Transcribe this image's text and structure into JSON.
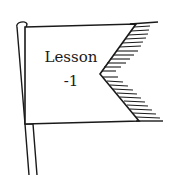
{
  "illustration": {
    "type": "hand-drawn flag",
    "line_color": "#1a1a1a",
    "fill_color": "#ffffff",
    "label_line1": "Lesson",
    "label_line2": "-1"
  }
}
